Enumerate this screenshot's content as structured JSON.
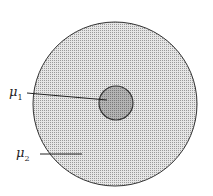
{
  "diagram": {
    "outer_region": {
      "label": "μ",
      "subscript": "2",
      "fill": "#d4d4d4",
      "stroke": "#333333"
    },
    "inner_region": {
      "label": "μ",
      "subscript": "1",
      "fill": "#a8a8a8",
      "stroke": "#333333"
    }
  }
}
